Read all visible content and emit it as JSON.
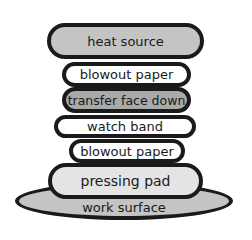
{
  "diagram": {
    "title": "",
    "layers": [
      {
        "id": "heat-source",
        "label": "heat source",
        "fill": "#c4c4c4"
      },
      {
        "id": "blowout-paper-top",
        "label": "blowout paper",
        "fill": "#ffffff"
      },
      {
        "id": "transfer-face-down",
        "label": "transfer face down",
        "fill": "#a9a9a9"
      },
      {
        "id": "watch-band",
        "label": "watch band",
        "fill": "#ffffff"
      },
      {
        "id": "blowout-paper-bottom",
        "label": "blowout paper",
        "fill": "#ffffff"
      },
      {
        "id": "pressing-pad",
        "label": "pressing pad",
        "fill": "#e4e4e4"
      },
      {
        "id": "work-surface",
        "label": "work surface",
        "fill": "#c4c4c4"
      }
    ]
  }
}
